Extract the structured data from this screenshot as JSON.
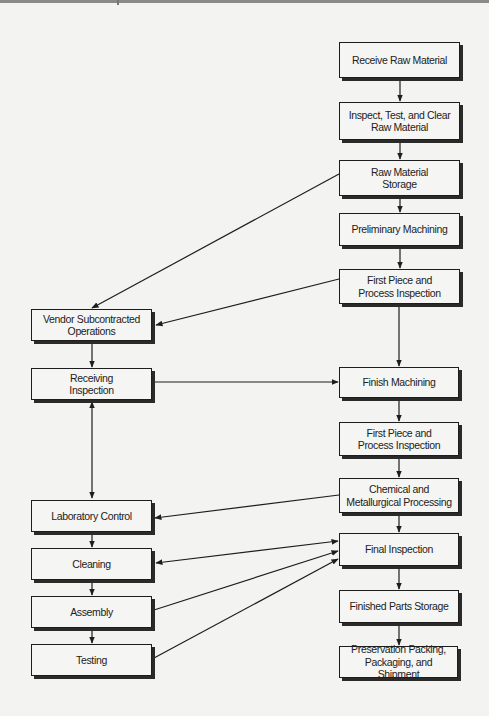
{
  "diagram": {
    "type": "process-flowchart",
    "nodes": {
      "receive_raw_material": {
        "label": "Receive Raw Material"
      },
      "inspect_test_clear": {
        "label": "Inspect, Test, and Clear Raw Material"
      },
      "raw_material_storage": {
        "label": "Raw Material Storage"
      },
      "preliminary_machining": {
        "label": "Preliminary Machining"
      },
      "first_piece_1": {
        "label": "First Piece and Process Inspection"
      },
      "finish_machining": {
        "label": "Finish Machining"
      },
      "first_piece_2": {
        "label": "First Piece and Process Inspection"
      },
      "chemical_metallurgical": {
        "label": "Chemical and Metallurgical Processing"
      },
      "final_inspection": {
        "label": "Final Inspection"
      },
      "finished_parts_storage": {
        "label": "Finished Parts Storage"
      },
      "preservation_packing": {
        "label": "Preservation Packing, Packaging, and Shipment"
      },
      "vendor_subcontracted": {
        "label": "Vendor Subcontracted Operations"
      },
      "receiving_inspection": {
        "label": "Receiving Inspection"
      },
      "laboratory_control": {
        "label": "Laboratory Control"
      },
      "cleaning": {
        "label": "Cleaning"
      },
      "assembly": {
        "label": "Assembly"
      },
      "testing": {
        "label": "Testing"
      }
    },
    "display_lines": {
      "receive_raw_material": [
        "Receive Raw Material"
      ],
      "inspect_test_clear": [
        "Inspect, Test, and Clear",
        "Raw Material"
      ],
      "raw_material_storage": [
        "Raw Material",
        "Storage"
      ],
      "preliminary_machining": [
        "Preliminary Machining"
      ],
      "first_piece_1": [
        "First Piece and",
        "Process Inspection"
      ],
      "finish_machining": [
        "Finish Machining"
      ],
      "first_piece_2": [
        "First Piece and",
        "Process Inspection"
      ],
      "chemical_metallurgical": [
        "Chemical and",
        "Metallurgical Processing"
      ],
      "final_inspection": [
        "Final Inspection"
      ],
      "finished_parts_storage": [
        "Finished Parts Storage"
      ],
      "preservation_packing": [
        "Preservation Packing,",
        "Packaging, and Shipment"
      ],
      "vendor_subcontracted": [
        "Vendor Subcontracted",
        "Operations"
      ],
      "receiving_inspection": [
        "Receiving",
        "Inspection"
      ],
      "laboratory_control": [
        "Laboratory Control"
      ],
      "cleaning": [
        "Cleaning"
      ],
      "assembly": [
        "Assembly"
      ],
      "testing": [
        "Testing"
      ]
    },
    "edges": [
      {
        "from": "receive_raw_material",
        "to": "inspect_test_clear",
        "direction": "forward"
      },
      {
        "from": "inspect_test_clear",
        "to": "raw_material_storage",
        "direction": "forward"
      },
      {
        "from": "raw_material_storage",
        "to": "preliminary_machining",
        "direction": "forward"
      },
      {
        "from": "raw_material_storage",
        "to": "vendor_subcontracted",
        "direction": "forward"
      },
      {
        "from": "preliminary_machining",
        "to": "first_piece_1",
        "direction": "forward"
      },
      {
        "from": "first_piece_1",
        "to": "vendor_subcontracted",
        "direction": "forward"
      },
      {
        "from": "first_piece_1",
        "to": "finish_machining",
        "direction": "forward"
      },
      {
        "from": "vendor_subcontracted",
        "to": "receiving_inspection",
        "direction": "forward"
      },
      {
        "from": "receiving_inspection",
        "to": "finish_machining",
        "direction": "forward"
      },
      {
        "from": "receiving_inspection",
        "to": "laboratory_control",
        "direction": "both"
      },
      {
        "from": "finish_machining",
        "to": "first_piece_2",
        "direction": "forward"
      },
      {
        "from": "first_piece_2",
        "to": "chemical_metallurgical",
        "direction": "forward"
      },
      {
        "from": "chemical_metallurgical",
        "to": "laboratory_control",
        "direction": "forward"
      },
      {
        "from": "chemical_metallurgical",
        "to": "final_inspection",
        "direction": "forward"
      },
      {
        "from": "laboratory_control",
        "to": "cleaning",
        "direction": "forward"
      },
      {
        "from": "cleaning",
        "to": "final_inspection",
        "direction": "both"
      },
      {
        "from": "cleaning",
        "to": "assembly",
        "direction": "forward"
      },
      {
        "from": "assembly",
        "to": "final_inspection",
        "direction": "forward"
      },
      {
        "from": "assembly",
        "to": "testing",
        "direction": "forward"
      },
      {
        "from": "testing",
        "to": "final_inspection",
        "direction": "forward"
      },
      {
        "from": "final_inspection",
        "to": "finished_parts_storage",
        "direction": "forward"
      },
      {
        "from": "finished_parts_storage",
        "to": "preservation_packing",
        "direction": "forward"
      }
    ]
  },
  "colors": {
    "background": "#f3f3f1",
    "box_fill": "#f5f5f3",
    "line": "#1d1d1d",
    "text": "#222222"
  }
}
